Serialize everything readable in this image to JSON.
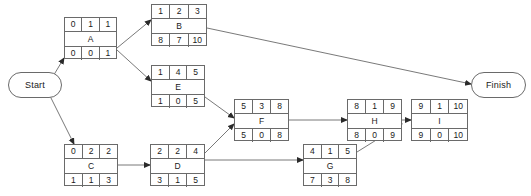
{
  "diagram": {
    "type": "project-network-diagram",
    "line_color": "#6a6a6a",
    "text_color": "#1a1a1a",
    "background": "#ffffff",
    "terminals": [
      {
        "id": "start",
        "label": "Start",
        "x": 8,
        "y": 72,
        "w": 54,
        "h": 26
      },
      {
        "id": "finish",
        "label": "Finish",
        "x": 471,
        "y": 72,
        "w": 55,
        "h": 26
      }
    ],
    "nodes": [
      {
        "id": "A",
        "label": "A",
        "x": 64,
        "y": 17,
        "w": 53,
        "h": 42,
        "top": [
          "0",
          "1",
          "1"
        ],
        "bottom": [
          "0",
          "0",
          "1"
        ]
      },
      {
        "id": "B",
        "label": "B",
        "x": 151,
        "y": 4,
        "w": 56,
        "h": 42,
        "top": [
          "1",
          "2",
          "3"
        ],
        "bottom": [
          "8",
          "7",
          "10"
        ]
      },
      {
        "id": "E",
        "label": "E",
        "x": 151,
        "y": 65,
        "w": 54,
        "h": 42,
        "top": [
          "1",
          "4",
          "5"
        ],
        "bottom": [
          "1",
          "0",
          "5"
        ]
      },
      {
        "id": "C",
        "label": "C",
        "x": 64,
        "y": 144,
        "w": 54,
        "h": 42,
        "top": [
          "0",
          "2",
          "2"
        ],
        "bottom": [
          "1",
          "1",
          "3"
        ]
      },
      {
        "id": "D",
        "label": "D",
        "x": 150,
        "y": 144,
        "w": 55,
        "h": 42,
        "top": [
          "2",
          "2",
          "4"
        ],
        "bottom": [
          "3",
          "1",
          "5"
        ]
      },
      {
        "id": "F",
        "label": "F",
        "x": 234,
        "y": 99,
        "w": 55,
        "h": 42,
        "top": [
          "5",
          "3",
          "8"
        ],
        "bottom": [
          "5",
          "0",
          "8"
        ]
      },
      {
        "id": "G",
        "label": "G",
        "x": 303,
        "y": 144,
        "w": 54,
        "h": 42,
        "top": [
          "4",
          "1",
          "5"
        ],
        "bottom": [
          "7",
          "3",
          "8"
        ]
      },
      {
        "id": "H",
        "label": "H",
        "x": 347,
        "y": 99,
        "w": 55,
        "h": 42,
        "top": [
          "8",
          "1",
          "9"
        ],
        "bottom": [
          "8",
          "0",
          "9"
        ]
      },
      {
        "id": "I",
        "label": "I",
        "x": 411,
        "y": 99,
        "w": 57,
        "h": 42,
        "top": [
          "9",
          "1",
          "10"
        ],
        "bottom": [
          "9",
          "0",
          "10"
        ]
      }
    ],
    "edges": [
      {
        "id": "start-to-A",
        "from": "Start",
        "to": "A",
        "points": "46,88 64,58"
      },
      {
        "id": "start-to-C",
        "from": "Start",
        "to": "C",
        "points": "50,96 74,144"
      },
      {
        "id": "A-to-B",
        "from": "A",
        "to": "B",
        "points": "117,48 151,20"
      },
      {
        "id": "A-to-E",
        "from": "A",
        "to": "E",
        "points": "117,50 151,81"
      },
      {
        "id": "B-to-Finish",
        "from": "B",
        "to": "Finish",
        "points": "207,28 471,84"
      },
      {
        "id": "E-to-F",
        "from": "E",
        "to": "F",
        "points": "205,97 234,118"
      },
      {
        "id": "C-to-D",
        "from": "C",
        "to": "D",
        "points": "118,165 150,165"
      },
      {
        "id": "D-to-F",
        "from": "D",
        "to": "F",
        "points": "205,153 234,124"
      },
      {
        "id": "D-to-G",
        "from": "D",
        "to": "G",
        "points": "205,160 303,160"
      },
      {
        "id": "F-to-H",
        "from": "F",
        "to": "H",
        "points": "289,120 347,120"
      },
      {
        "id": "G-to-H",
        "from": "G",
        "to": "H",
        "points": "357,152 402,124"
      },
      {
        "id": "H-to-I",
        "from": "H",
        "to": "I",
        "points": "402,120 411,120"
      }
    ]
  }
}
